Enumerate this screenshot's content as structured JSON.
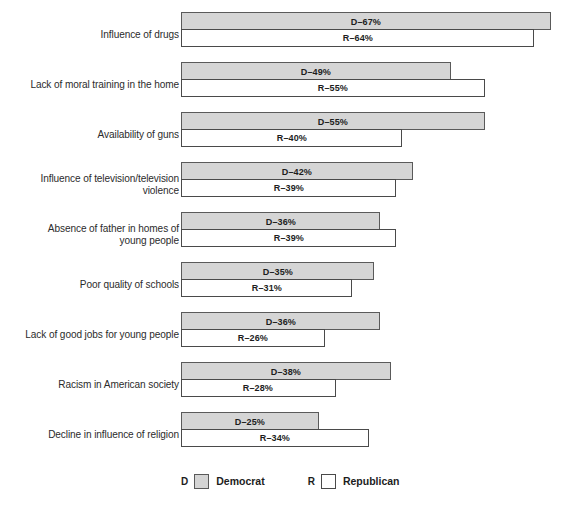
{
  "chart_data": {
    "type": "bar",
    "orientation": "horizontal",
    "title": "",
    "xlabel": "",
    "ylabel": "",
    "xlim": [
      0,
      70
    ],
    "grid": false,
    "legend_position": "bottom",
    "value_suffix": "%",
    "categories": [
      "Influence of drugs",
      "Lack of moral training in the home",
      "Availability of guns",
      "Influence of television/television violence",
      "Absence of father in homes of young people",
      "Poor quality of schools",
      "Lack of good jobs for young people",
      "Racism in American society",
      "Decline in influence of religion"
    ],
    "series": [
      {
        "name": "Democrat",
        "key": "D",
        "color": "#d5d5d5",
        "values": [
          67,
          49,
          55,
          42,
          36,
          35,
          36,
          38,
          25
        ]
      },
      {
        "name": "Republican",
        "key": "R",
        "color": "#ffffff",
        "values": [
          64,
          55,
          40,
          39,
          39,
          31,
          26,
          28,
          34
        ]
      }
    ]
  },
  "rows": [
    {
      "label_lines": [
        "Influence of drugs"
      ],
      "d": {
        "value": 67,
        "text": "D–67%"
      },
      "r": {
        "value": 64,
        "text": "R–64%"
      }
    },
    {
      "label_lines": [
        "Lack of moral training in the home"
      ],
      "d": {
        "value": 49,
        "text": "D–49%"
      },
      "r": {
        "value": 55,
        "text": "R–55%"
      }
    },
    {
      "label_lines": [
        "Availability of guns"
      ],
      "d": {
        "value": 55,
        "text": "D–55%"
      },
      "r": {
        "value": 40,
        "text": "R–40%"
      }
    },
    {
      "label_lines": [
        "Influence of television/television",
        "violence"
      ],
      "d": {
        "value": 42,
        "text": "D–42%"
      },
      "r": {
        "value": 39,
        "text": "R–39%"
      }
    },
    {
      "label_lines": [
        "Absence of father in homes of",
        "young people"
      ],
      "d": {
        "value": 36,
        "text": "D–36%"
      },
      "r": {
        "value": 39,
        "text": "R–39%"
      }
    },
    {
      "label_lines": [
        "Poor quality of schools"
      ],
      "d": {
        "value": 35,
        "text": "D–35%"
      },
      "r": {
        "value": 31,
        "text": "R–31%"
      }
    },
    {
      "label_lines": [
        "Lack of good jobs for young people"
      ],
      "d": {
        "value": 36,
        "text": "D–36%"
      },
      "r": {
        "value": 26,
        "text": "R–26%"
      }
    },
    {
      "label_lines": [
        "Racism in American society"
      ],
      "d": {
        "value": 38,
        "text": "D–38%"
      },
      "r": {
        "value": 28,
        "text": "R–28%"
      }
    },
    {
      "label_lines": [
        "Decline in influence of religion"
      ],
      "d": {
        "value": 25,
        "text": "D–25%"
      },
      "r": {
        "value": 34,
        "text": "R–34%"
      }
    }
  ],
  "legend": {
    "democrat_key": "D",
    "democrat_label": "Democrat",
    "republican_key": "R",
    "republican_label": "Republican",
    "democrat_color": "#d5d5d5",
    "republican_color": "#ffffff"
  },
  "layout": {
    "bar_origin_x": 181,
    "px_per_percent": 5.52,
    "row_pitch": 50,
    "first_row_top": 12,
    "bar_height": 18
  }
}
